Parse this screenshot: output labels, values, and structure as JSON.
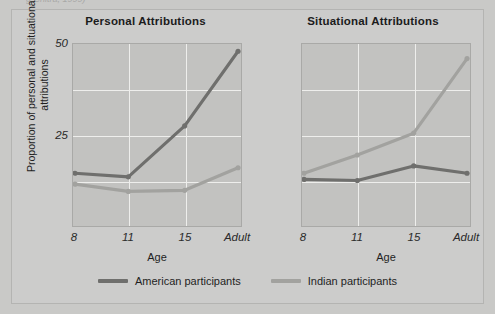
{
  "figure": {
    "cropped_caption_fragment": "g Chitra, 1999)",
    "background_color": "#cccccb",
    "plot_background_color": "#c2c2c0",
    "gridline_color": "#eeeeec"
  },
  "axes": {
    "y_title": "Proportion of personal and situational attributions",
    "y_ticks": [
      {
        "label": "50",
        "value": 50
      },
      {
        "label": "25",
        "value": 25
      }
    ],
    "y_min": 0,
    "y_max": 50,
    "gridlines_y": [
      12.5,
      25,
      37.5
    ],
    "x_title": "Age",
    "x_ticks": [
      "8",
      "11",
      "15",
      "Adult"
    ]
  },
  "legend": {
    "position": "bottom-center",
    "items": [
      {
        "label": "American participants",
        "color": "#6f6f6d"
      },
      {
        "label": "Indian participants",
        "color": "#a2a29f"
      }
    ]
  },
  "chart_data": [
    {
      "type": "line",
      "title": "Personal Attributions",
      "xlabel": "Age",
      "ylabel": "Proportion of personal and situational attributions",
      "categories": [
        "8",
        "11",
        "15",
        "Adult"
      ],
      "ylim": [
        0,
        50
      ],
      "grid": true,
      "series": [
        {
          "name": "American participants",
          "color": "#6f6f6d",
          "values": [
            14.5,
            13.5,
            27.5,
            48
          ]
        },
        {
          "name": "Indian participants",
          "color": "#a2a29f",
          "values": [
            11.5,
            9.5,
            9.8,
            16
          ]
        }
      ]
    },
    {
      "type": "line",
      "title": "Situational Attributions",
      "xlabel": "Age",
      "ylabel": "Proportion of personal and situational attributions",
      "categories": [
        "8",
        "11",
        "15",
        "Adult"
      ],
      "ylim": [
        0,
        50
      ],
      "grid": true,
      "series": [
        {
          "name": "American participants",
          "color": "#6f6f6d",
          "values": [
            12.8,
            12.5,
            16.5,
            14.5
          ]
        },
        {
          "name": "Indian participants",
          "color": "#a2a29f",
          "values": [
            14.5,
            19.5,
            25.5,
            46
          ]
        }
      ]
    }
  ]
}
